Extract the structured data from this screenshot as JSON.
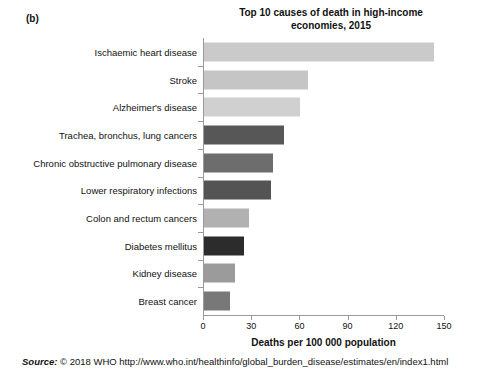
{
  "panel_label": "(b)",
  "chart_data": {
    "type": "bar",
    "orientation": "horizontal",
    "title": "Top 10 causes of death in high-income economies, 2015",
    "title_lines": [
      "Top 10 causes of death in high-income",
      "economies, 2015"
    ],
    "xlabel": "Deaths per 100 000 population",
    "ylabel": "",
    "xlim": [
      0,
      150
    ],
    "xticks": [
      0,
      30,
      60,
      90,
      120,
      150
    ],
    "xtick_labels": [
      "0",
      "30",
      "60",
      "90",
      "120",
      "150"
    ],
    "grid": false,
    "legend": false,
    "categories": [
      "Ischaemic heart disease",
      "Stroke",
      "Alzheimer's disease",
      "Trachea, bronchus, lung cancers",
      "Chronic obstructive pulmonary disease",
      "Lower respiratory infections",
      "Colon and rectum cancers",
      "Diabetes mellitus",
      "Kidney disease",
      "Breast cancer"
    ],
    "values": [
      143,
      65,
      60,
      50,
      43,
      42,
      28,
      25,
      19,
      16
    ],
    "bar_colors": [
      "#cacaca",
      "#c5c5c5",
      "#d0d0d0",
      "#575757",
      "#6d6d6d",
      "#545454",
      "#b1b1b1",
      "#2c2c2c",
      "#9b9b9b",
      "#787878"
    ]
  },
  "source": {
    "label": "Source:",
    "text": "© 2018 WHO http://www.who.int/healthinfo/global_burden_disease/estimates/en/index1.html"
  }
}
